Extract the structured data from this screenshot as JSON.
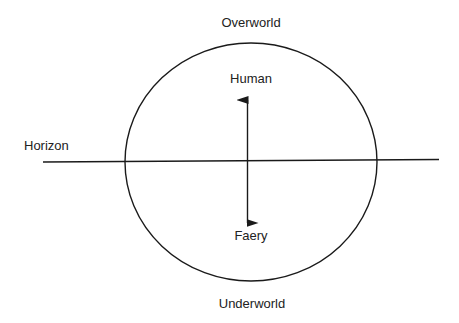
{
  "diagram": {
    "type": "cosmology-diagram",
    "labels": {
      "top": "Overworld",
      "bottom": "Underworld",
      "horizon": "Horizon",
      "upper_realm": "Human",
      "lower_realm": "Faery"
    },
    "elements": {
      "circle": "world-circle",
      "horizon_line": "horizon-line",
      "arrow": "bidirectional-arrow"
    },
    "relations": [
      {
        "from": "Human",
        "to": "Faery",
        "kind": "bidirectional"
      }
    ],
    "colors": {
      "stroke": "#1a1a1a",
      "text": "#222222",
      "background": "#ffffff"
    }
  }
}
